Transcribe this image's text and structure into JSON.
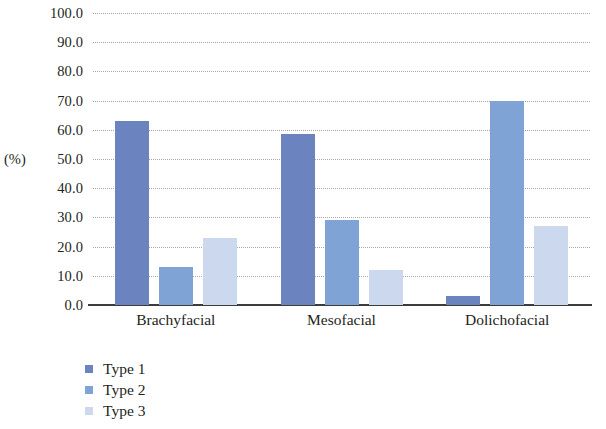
{
  "chart_data": {
    "type": "bar",
    "title": "",
    "xlabel": "",
    "ylabel": "(%)",
    "ylim": [
      0,
      100
    ],
    "ytick_step": 10,
    "grid": true,
    "grid_style": "dotted-horizontal",
    "legend_position": "bottom-left",
    "categories": [
      "Brachyfacial",
      "Mesofacial",
      "Dolichofacial"
    ],
    "ytick_labels": [
      "100.0",
      "90.0",
      "80.0",
      "70.0",
      "60.0",
      "50.0",
      "40.0",
      "30.0",
      "20.0",
      "10.0",
      "0.0"
    ],
    "series": [
      {
        "name": "Type 1",
        "color": "#6b84c0",
        "values": [
          63.0,
          58.5,
          3.0
        ]
      },
      {
        "name": "Type 2",
        "color": "#7ea3d4",
        "values": [
          13.0,
          29.0,
          70.0
        ]
      },
      {
        "name": "Type 3",
        "color": "#cbd8ee",
        "values": [
          23.0,
          12.0,
          27.0
        ]
      }
    ]
  },
  "axis": {
    "line_color": "#3b3b3b",
    "grid_color": "#9a9a9a"
  }
}
